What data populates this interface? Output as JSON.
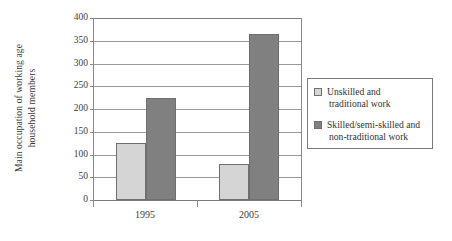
{
  "chart_data": {
    "type": "bar",
    "title": "",
    "xlabel": "",
    "ylabel_line1": "Main occupation of working age",
    "ylabel_line2": "household members",
    "categories": [
      "1995",
      "2005"
    ],
    "series": [
      {
        "name": "Unskilled and traditional work",
        "values": [
          125,
          80
        ]
      },
      {
        "name": "Skilled/semi-skilled and non-traditional work",
        "values": [
          225,
          365
        ]
      }
    ],
    "ylim": [
      0,
      400
    ],
    "ytick_labels": [
      "400",
      "350",
      "300",
      "250",
      "200",
      "150",
      "100",
      "50",
      "0"
    ],
    "ytick_values": [
      400,
      350,
      300,
      250,
      200,
      150,
      100,
      50,
      0
    ],
    "grid": true,
    "legend_position": "right-outside",
    "colors": {
      "series1_fill": "#d5d5d5",
      "series2_fill": "#808080",
      "bar_edge": "#6f6f6f",
      "grid": "#9a9a9a",
      "axis": "#7a7a7a",
      "text": "#3d3d3d"
    }
  },
  "legend": {
    "items": [
      {
        "label_line1": "Unskilled and",
        "label_line2": "traditional work"
      },
      {
        "label_line1": "Skilled/semi-skilled and",
        "label_line2": "non-traditional work"
      }
    ]
  }
}
